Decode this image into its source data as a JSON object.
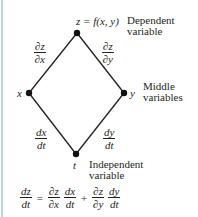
{
  "diagram": {
    "type": "tree",
    "nodes": [
      {
        "id": "z",
        "label": "z = f(x, y)",
        "role": "Dependent variable",
        "x": 77,
        "y": 33
      },
      {
        "id": "x",
        "label": "x",
        "role": "Middle variables",
        "x": 29,
        "y": 93
      },
      {
        "id": "y",
        "label": "y",
        "role": "Middle variables",
        "x": 124,
        "y": 93
      },
      {
        "id": "t",
        "label": "t",
        "role": "Independent variable",
        "x": 76,
        "y": 154
      }
    ],
    "edges": [
      {
        "from": "z",
        "to": "x",
        "label_num": "∂z",
        "label_den": "∂x"
      },
      {
        "from": "z",
        "to": "y",
        "label_num": "∂z",
        "label_den": "∂y"
      },
      {
        "from": "x",
        "to": "t",
        "label_num": "dx",
        "label_den": "dt"
      },
      {
        "from": "y",
        "to": "t",
        "label_num": "dy",
        "label_den": "dt"
      }
    ],
    "labels": {
      "top_node": "z = f(x, y)",
      "x_node": "x",
      "y_node": "y",
      "t_node": "t",
      "dependent_line1": "Dependent",
      "dependent_line2": "variable",
      "middle_line1": "Middle",
      "middle_line2": "variables",
      "independent_line1": "Independent",
      "independent_line2": "variable"
    },
    "formula": {
      "lhs_num": "dz",
      "lhs_den": "dt",
      "equals": "=",
      "t1a_num": "∂z",
      "t1a_den": "∂x",
      "t1b_num": "dx",
      "t1b_den": "dt",
      "plus": "+",
      "t2a_num": "∂z",
      "t2a_den": "∂y",
      "t2b_num": "dy",
      "t2b_den": "dt"
    }
  },
  "colors": {
    "ink": "#231f20",
    "left_border": "#b9d3ec",
    "background": "#ffffff"
  }
}
